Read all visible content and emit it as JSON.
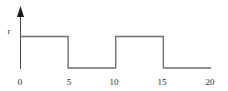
{
  "figure": {
    "background_color": "#ffffff",
    "line_color": "#6e6e6e",
    "axis_color": "#4a4a4a",
    "text_color": "#2b2b2b",
    "y_axis_label": "r",
    "y_axis_arrow": "arrow-up-icon"
  },
  "chart_data": {
    "type": "line",
    "title": "",
    "subtitle": "",
    "xlabel": "",
    "ylabel": "r",
    "waveform": "square",
    "x": [
      0,
      5,
      5,
      10,
      10,
      15,
      15,
      20
    ],
    "y": [
      1,
      1,
      0,
      0,
      1,
      1,
      0,
      0
    ],
    "series": [
      {
        "name": "r(t)",
        "x": [
          0,
          5,
          5,
          10,
          10,
          15,
          15,
          20
        ],
        "values": [
          1,
          1,
          0,
          0,
          1,
          1,
          0,
          0
        ]
      }
    ],
    "segments": [
      {
        "from": 0,
        "to": 5,
        "level": "high"
      },
      {
        "from": 5,
        "to": 10,
        "level": "low"
      },
      {
        "from": 10,
        "to": 15,
        "level": "high"
      },
      {
        "from": 15,
        "to": 20,
        "level": "low"
      }
    ],
    "levels": {
      "high_label": "r",
      "high_value": 1,
      "low_value": 0
    },
    "period": 10,
    "duty_cycle": 0.5,
    "xticks": [
      0,
      5,
      10,
      15,
      20
    ],
    "xtick_labels": [
      "0",
      "5",
      "10",
      "15",
      "20"
    ],
    "yticks": [],
    "ytick_labels": [
      "r"
    ],
    "xlim": [
      0,
      20
    ],
    "ylim": [
      0,
      1.35
    ],
    "grid": false,
    "legend": false,
    "legend_position": "none",
    "annotations": []
  },
  "labels": {
    "y_label": "r",
    "x_0": "0",
    "x_5": "5",
    "x_10": "10",
    "x_15": "15",
    "x_20": "20"
  }
}
